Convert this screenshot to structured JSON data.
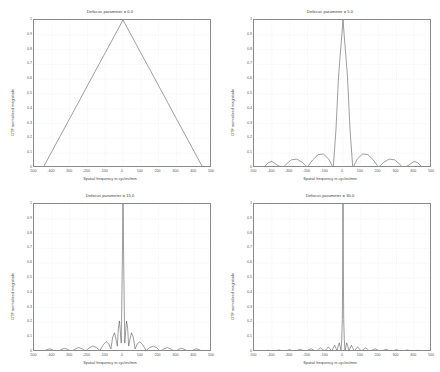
{
  "figure": {
    "background": "#ffffff",
    "axis_color": "#8a8a8a",
    "grid_color": "#d9d9d9",
    "line_color": "#4d4d4d",
    "panel_count": 4
  },
  "common": {
    "xlabel": "Spatial frequency in cycles/mm",
    "ylabel": "OTF normalized magnitude",
    "xticks": [
      "-500",
      "-400",
      "-300",
      "-200",
      "-100",
      "0",
      "100",
      "200",
      "300",
      "400",
      "500"
    ],
    "yticks": [
      "0",
      "0.1",
      "0.2",
      "0.3",
      "0.4",
      "0.5",
      "0.6",
      "0.7",
      "0.8",
      "0.9",
      "1"
    ]
  },
  "panels": [
    {
      "title": "Defocus parameter = 0.0",
      "defocus": 0.0,
      "position": "top-left"
    },
    {
      "title": "Defocus parameter = 5.0",
      "defocus": 5.0,
      "position": "top-right"
    },
    {
      "title": "Defocus parameter = 15.0",
      "defocus": 15.0,
      "position": "bottom-left"
    },
    {
      "title": "Defocus parameter = 30.0",
      "defocus": 30.0,
      "position": "bottom-right"
    }
  ],
  "chart_data": [
    {
      "type": "line",
      "title": "Defocus parameter = 0.0",
      "xlabel": "Spatial frequency in cycles/mm",
      "ylabel": "OTF normalized magnitude",
      "xlim": [
        -500,
        500
      ],
      "ylim": [
        0,
        1
      ],
      "xticks": [
        -500,
        -400,
        -300,
        -200,
        -100,
        0,
        100,
        200,
        300,
        400,
        500
      ],
      "yticks": [
        0,
        0.1,
        0.2,
        0.3,
        0.4,
        0.5,
        0.6,
        0.7,
        0.8,
        0.9,
        1
      ],
      "grid": true,
      "legend": null,
      "cutoff": 450,
      "series": [
        {
          "name": "OTF magnitude",
          "x": [
            -500,
            -450,
            -400,
            -350,
            -300,
            -250,
            -200,
            -150,
            -100,
            -50,
            0,
            50,
            100,
            150,
            200,
            250,
            300,
            350,
            400,
            450,
            500
          ],
          "values": [
            0,
            0,
            0.111,
            0.222,
            0.333,
            0.444,
            0.556,
            0.667,
            0.778,
            0.889,
            1.0,
            0.889,
            0.778,
            0.667,
            0.556,
            0.444,
            0.333,
            0.222,
            0.111,
            0,
            0
          ]
        }
      ]
    },
    {
      "type": "line",
      "title": "Defocus parameter = 5.0",
      "xlabel": "Spatial frequency in cycles/mm",
      "ylabel": "OTF normalized magnitude",
      "xlim": [
        -500,
        500
      ],
      "ylim": [
        0,
        1
      ],
      "xticks": [
        -500,
        -400,
        -300,
        -200,
        -100,
        0,
        100,
        200,
        300,
        400,
        500
      ],
      "yticks": [
        0,
        0.1,
        0.2,
        0.3,
        0.4,
        0.5,
        0.6,
        0.7,
        0.8,
        0.9,
        1
      ],
      "grid": true,
      "legend": null,
      "cutoff": 450,
      "lobe_scale": 5.0,
      "series": [
        {
          "name": "OTF magnitude",
          "x": [
            -450,
            -420,
            -400,
            -370,
            -340,
            -310,
            -290,
            -260,
            -230,
            -200,
            -170,
            -140,
            -110,
            -80,
            -55,
            -40,
            -25,
            0,
            25,
            40,
            55,
            80,
            110,
            140,
            170,
            200,
            230,
            260,
            290,
            310,
            340,
            370,
            400,
            420,
            450
          ],
          "values": [
            0,
            0.035,
            0.045,
            0.02,
            0.0,
            0.035,
            0.055,
            0.06,
            0.04,
            0.005,
            0.055,
            0.09,
            0.095,
            0.06,
            0.0,
            0.25,
            0.62,
            1.0,
            0.62,
            0.25,
            0.0,
            0.06,
            0.095,
            0.09,
            0.055,
            0.005,
            0.04,
            0.06,
            0.055,
            0.035,
            0.0,
            0.02,
            0.045,
            0.035,
            0
          ]
        }
      ]
    },
    {
      "type": "line",
      "title": "Defocus parameter = 15.0",
      "xlabel": "Spatial frequency in cycles/mm",
      "ylabel": "OTF normalized magnitude",
      "xlim": [
        -500,
        500
      ],
      "ylim": [
        0,
        1
      ],
      "xticks": [
        -500,
        -400,
        -300,
        -200,
        -100,
        0,
        100,
        200,
        300,
        400,
        500
      ],
      "yticks": [
        0,
        0.1,
        0.2,
        0.3,
        0.4,
        0.5,
        0.6,
        0.7,
        0.8,
        0.9,
        1
      ],
      "grid": true,
      "legend": null,
      "cutoff": 450,
      "lobe_scale": 15.0,
      "series": [
        {
          "name": "OTF magnitude",
          "x": [
            -450,
            -430,
            -410,
            -390,
            -370,
            -350,
            -330,
            -310,
            -290,
            -270,
            -250,
            -230,
            -210,
            -190,
            -170,
            -150,
            -130,
            -110,
            -95,
            -80,
            -68,
            -58,
            -48,
            -40,
            -32,
            -26,
            -20,
            -15,
            -10,
            -5,
            0,
            5,
            10,
            15,
            20,
            26,
            32,
            40,
            48,
            58,
            68,
            80,
            95,
            110,
            130,
            150,
            170,
            190,
            210,
            230,
            250,
            270,
            290,
            310,
            330,
            350,
            370,
            390,
            410,
            430,
            450
          ],
          "values": [
            0,
            0.015,
            0.022,
            0.01,
            0.0,
            0.015,
            0.025,
            0.018,
            0.0,
            0.02,
            0.03,
            0.022,
            0.005,
            0.028,
            0.04,
            0.03,
            0.01,
            0.05,
            0.07,
            0.055,
            0.02,
            0.1,
            0.13,
            0.09,
            0.04,
            0.16,
            0.21,
            0.14,
            0.06,
            0.5,
            1.0,
            0.5,
            0.06,
            0.14,
            0.21,
            0.16,
            0.04,
            0.09,
            0.13,
            0.1,
            0.02,
            0.055,
            0.07,
            0.05,
            0.01,
            0.03,
            0.04,
            0.028,
            0.005,
            0.022,
            0.03,
            0.02,
            0.0,
            0.018,
            0.025,
            0.015,
            0.0,
            0.01,
            0.022,
            0.015,
            0
          ]
        }
      ]
    },
    {
      "type": "line",
      "title": "Defocus parameter = 30.0",
      "xlabel": "Spatial frequency in cycles/mm",
      "ylabel": "OTF normalized magnitude",
      "xlim": [
        -500,
        500
      ],
      "ylim": [
        0,
        1
      ],
      "xticks": [
        -500,
        -400,
        -300,
        -200,
        -100,
        0,
        100,
        200,
        300,
        400,
        500
      ],
      "yticks": [
        0,
        0.1,
        0.2,
        0.3,
        0.4,
        0.5,
        0.6,
        0.7,
        0.8,
        0.9,
        1
      ],
      "grid": true,
      "legend": null,
      "cutoff": 450,
      "lobe_scale": 30.0,
      "series": [
        {
          "name": "OTF magnitude",
          "x": [
            -450,
            -435,
            -420,
            -405,
            -390,
            -375,
            -360,
            -345,
            -330,
            -315,
            -300,
            -285,
            -270,
            -255,
            -240,
            -225,
            -210,
            -195,
            -180,
            -165,
            -150,
            -138,
            -126,
            -114,
            -102,
            -92,
            -82,
            -72,
            -63,
            -55,
            -47,
            -40,
            -33,
            -27,
            -21,
            -16,
            -11,
            -7,
            -4,
            -2,
            0,
            2,
            4,
            7,
            11,
            16,
            21,
            27,
            33,
            40,
            47,
            55,
            63,
            72,
            82,
            92,
            102,
            114,
            126,
            138,
            150,
            165,
            180,
            195,
            210,
            225,
            240,
            255,
            270,
            285,
            300,
            315,
            330,
            345,
            360,
            375,
            390,
            405,
            420,
            435,
            450
          ],
          "values": [
            0,
            0.008,
            0.012,
            0.006,
            0.0,
            0.009,
            0.014,
            0.008,
            0.0,
            0.01,
            0.016,
            0.009,
            0.002,
            0.012,
            0.018,
            0.01,
            0.003,
            0.014,
            0.022,
            0.013,
            0.004,
            0.018,
            0.028,
            0.016,
            0.005,
            0.022,
            0.034,
            0.02,
            0.006,
            0.028,
            0.045,
            0.026,
            0.008,
            0.04,
            0.062,
            0.035,
            0.01,
            0.09,
            0.22,
            0.5,
            1.0,
            0.5,
            0.22,
            0.09,
            0.01,
            0.035,
            0.062,
            0.04,
            0.008,
            0.026,
            0.045,
            0.028,
            0.006,
            0.02,
            0.034,
            0.022,
            0.005,
            0.016,
            0.028,
            0.018,
            0.004,
            0.013,
            0.022,
            0.014,
            0.003,
            0.01,
            0.018,
            0.012,
            0.002,
            0.009,
            0.016,
            0.01,
            0.0,
            0.008,
            0.014,
            0.009,
            0.0,
            0.006,
            0.012,
            0.008,
            0
          ]
        }
      ]
    }
  ]
}
